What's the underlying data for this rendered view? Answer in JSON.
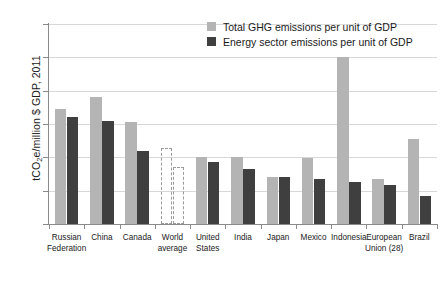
{
  "chart_data": {
    "type": "bar",
    "title": "",
    "xlabel": "",
    "ylabel": "tCO2e/million $ GDP, 2011",
    "ylabel_prefix": "tCO",
    "ylabel_sub": "2",
    "ylabel_suffix": "e/million $ GDP, 2011",
    "ylim": [
      0,
      1200
    ],
    "yticks": [
      0,
      200,
      400,
      600,
      800,
      1000,
      1200
    ],
    "ytick_labels": [
      "0",
      "200",
      "400",
      "600",
      "800",
      "1000",
      "1200"
    ],
    "grid": true,
    "legend_position": "top-right",
    "categories": [
      "Russian Federation",
      "China",
      "Canada",
      "World average",
      "United States",
      "India",
      "Japan",
      "Mexico",
      "Indonesia",
      "European Union (28)",
      "Brazil"
    ],
    "category_lines": [
      [
        "Russian",
        "Federation"
      ],
      [
        "China"
      ],
      [
        "Canada"
      ],
      [
        "World",
        "average"
      ],
      [
        "United",
        "States"
      ],
      [
        "India"
      ],
      [
        "Japan"
      ],
      [
        "Mexico"
      ],
      [
        "Indonesia"
      ],
      [
        "European",
        "Union (28)"
      ],
      [
        "Brazil"
      ]
    ],
    "series": [
      {
        "name": "Total GHG emissions per unit of GDP",
        "color": "#b4b4b4",
        "values": [
          690,
          765,
          615,
          455,
          400,
          400,
          280,
          395,
          1000,
          270,
          510
        ]
      },
      {
        "name": "Energy sector emissions per unit of GDP",
        "color": "#3f3f3f",
        "values": [
          645,
          620,
          440,
          340,
          375,
          330,
          285,
          270,
          255,
          235,
          170
        ]
      }
    ],
    "special_styles": {
      "World average": "dashed-outline"
    },
    "legend": [
      {
        "label": "Total GHG emissions per unit of GDP",
        "swatch": "total",
        "color": "#b4b4b4"
      },
      {
        "label": "Energy sector emissions per unit of GDP",
        "swatch": "energy",
        "color": "#3f3f3f"
      }
    ]
  }
}
